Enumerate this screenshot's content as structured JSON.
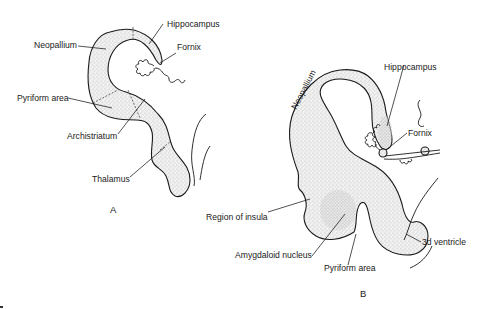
{
  "figure": {
    "panels": [
      {
        "id": "A",
        "caption": "A",
        "labels": {
          "neopallium": "Neopallium",
          "hippocampus": "Hippocampus",
          "fornix": "Fornix",
          "pyriform_area": "Pyriform area",
          "archistriatum": "Archistriatum",
          "thalamus": "Thalamus"
        }
      },
      {
        "id": "B",
        "caption": "B",
        "labels": {
          "neopallium": "Neopallium",
          "hippocampus": "Hippocampus",
          "fornix": "Fornix",
          "region_of_insula": "Region of insula",
          "amygdaloid_nucleus": "Amygdaloid nucleus",
          "pyriform_area": "Pyriform area",
          "third_ventricle": "3d ventricle"
        }
      }
    ],
    "colors": {
      "ink": "#1a1a1a",
      "stipple": "#b8b8b8",
      "background": "#ffffff"
    }
  }
}
